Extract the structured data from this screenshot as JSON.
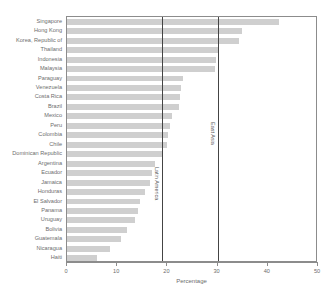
{
  "chart_data": {
    "type": "bar",
    "orientation": "horizontal",
    "title": "",
    "xlabel": "Percentage",
    "ylabel": "",
    "xlim": [
      0,
      50
    ],
    "xticks": [
      0,
      10,
      20,
      30,
      40,
      50
    ],
    "grid": false,
    "legend": null,
    "bar_color": "#cfcfcf",
    "categories": [
      "Singapore",
      "Hong Kong",
      "Korea, Republic of",
      "Thailand",
      "Indonesia",
      "Malaysia",
      "Paraguay",
      "Venezuela",
      "Costa Rica",
      "Brazil",
      "Mexico",
      "Peru",
      "Colombia",
      "Chile",
      "Dominican Republic",
      "Argentina",
      "Ecuador",
      "Jamaica",
      "Honduras",
      "El Salvador",
      "Panama",
      "Uruguay",
      "Bolivia",
      "Guatemala",
      "Nicaragua",
      "Haiti"
    ],
    "values": [
      42.2,
      34.8,
      34.2,
      30.0,
      29.6,
      29.4,
      23.2,
      22.8,
      22.6,
      22.4,
      21.0,
      20.6,
      20.2,
      20.0,
      19.0,
      17.6,
      17.0,
      16.6,
      15.6,
      14.6,
      14.2,
      13.6,
      12.0,
      10.8,
      8.6,
      6.0
    ],
    "annotations": [
      {
        "label": "Latin America",
        "value": 19.0
      },
      {
        "label": "East Asia",
        "value": 30.0
      }
    ]
  }
}
